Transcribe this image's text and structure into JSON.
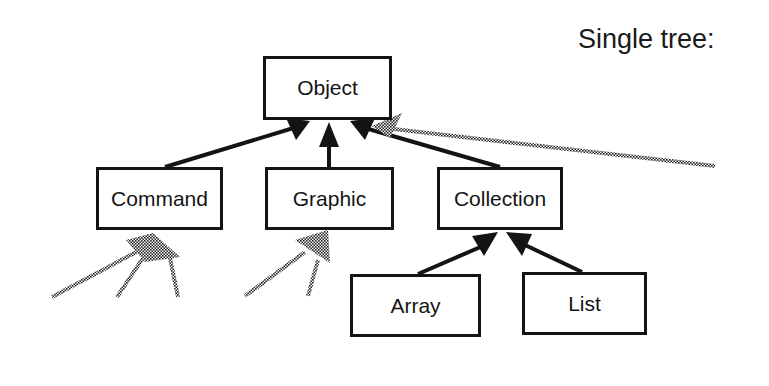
{
  "title": "Single tree:",
  "nodes": {
    "object": "Object",
    "command": "Command",
    "graphic": "Graphic",
    "collection": "Collection",
    "array": "Array",
    "list": "List"
  },
  "colors": {
    "line": "#141414",
    "dotted_line": "#555555",
    "background": "#ffffff"
  }
}
